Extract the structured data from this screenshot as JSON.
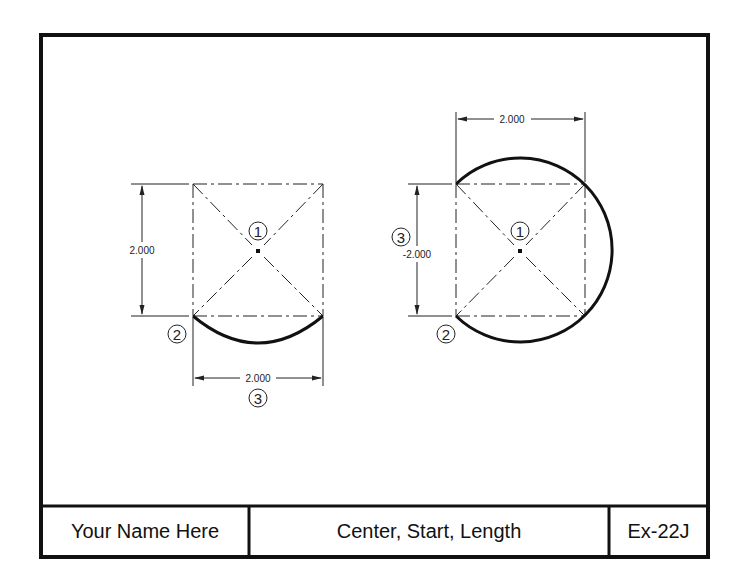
{
  "title_block": {
    "name": "Your Name Here",
    "title": "Center, Start, Length",
    "exercise": "Ex-22J"
  },
  "colors": {
    "line": "#111111",
    "background": "#ffffff"
  },
  "left_figure": {
    "vertical_dimension": "2.000",
    "horizontal_dimension": "2.000",
    "callouts": {
      "center": "1",
      "start": "2",
      "length": "3"
    }
  },
  "right_figure": {
    "vertical_dimension": "-2.000",
    "horizontal_dimension": "2.000",
    "callouts": {
      "center": "1",
      "start": "2",
      "length": "3"
    }
  }
}
